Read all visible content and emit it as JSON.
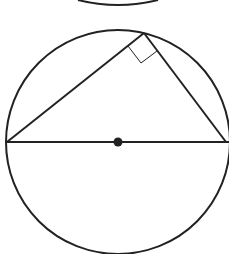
{
  "diagram": {
    "colors": {
      "stroke": "#222222",
      "background": "#ffffff",
      "marker": "#222222"
    },
    "circle": {
      "cx": 118,
      "cy": 142,
      "r": 112
    },
    "center_point": {
      "x": 118,
      "y": 142
    },
    "diameter": {
      "x1": 6,
      "y1": 142,
      "x2": 230,
      "y2": 142
    },
    "triangle_apex": {
      "x": 144,
      "y": 33
    },
    "right_angle_marker": true,
    "partial_arc_top": true
  }
}
